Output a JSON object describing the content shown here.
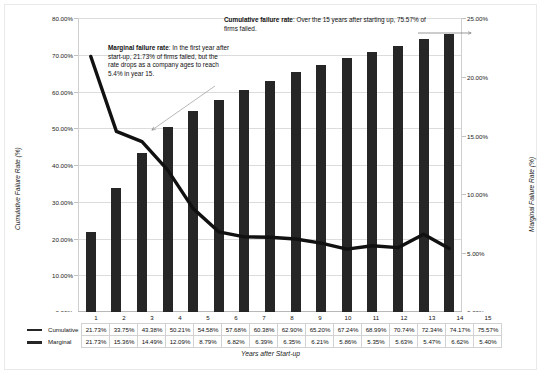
{
  "chart_data": {
    "type": "bar",
    "title": "",
    "xlabel": "Years after Start-up",
    "ylabel": "Cumulative Failure Rate (%)",
    "y2label": "Marginal Failure Rate (%)",
    "categories": [
      "1",
      "2",
      "3",
      "4",
      "5",
      "6",
      "7",
      "8",
      "9",
      "10",
      "11",
      "12",
      "13",
      "14",
      "15"
    ],
    "ylim": [
      0,
      80
    ],
    "y2lim": [
      0,
      25
    ],
    "grid": true,
    "legend_position": "table-below",
    "series": [
      {
        "name": "Cumulative",
        "type": "bar",
        "axis": "left",
        "values": [
          21.73,
          33.75,
          43.38,
          50.21,
          54.58,
          57.68,
          60.38,
          62.9,
          65.2,
          67.24,
          68.99,
          70.74,
          72.34,
          74.17,
          75.57
        ],
        "labels": [
          "21.73%",
          "33.75%",
          "43.38%",
          "50.21%",
          "54.58%",
          "57.68%",
          "60.38%",
          "62.90%",
          "65.20%",
          "67.24%",
          "68.99%",
          "70.74%",
          "72.34%",
          "74.17%",
          "75.57%"
        ],
        "color": "#262626"
      },
      {
        "name": "Marginal",
        "type": "line",
        "axis": "right",
        "values": [
          21.73,
          15.36,
          14.49,
          12.09,
          8.79,
          6.82,
          6.39,
          6.35,
          6.21,
          5.86,
          5.35,
          5.63,
          5.47,
          6.62,
          5.4
        ],
        "labels": [
          "21.73%",
          "15.36%",
          "14.49%",
          "12.09%",
          "8.79%",
          "6.82%",
          "6.39%",
          "6.35%",
          "6.21%",
          "5.86%",
          "5.35%",
          "5.63%",
          "5.47%",
          "6.62%",
          "5.40%"
        ],
        "color": "#111111"
      }
    ],
    "yticks": [
      "0.00%",
      "10.00%",
      "20.00%",
      "30.00%",
      "40.00%",
      "50.00%",
      "60.00%",
      "70.00%",
      "80.00%"
    ],
    "y2ticks": [
      "0.00%",
      "5.00%",
      "10.00%",
      "15.00%",
      "20.00%",
      "25.00%"
    ],
    "annotations": [
      {
        "name": "marginal",
        "lead": "Marginal failure rate",
        "text": ": In the first year after start-up, 21.73% of firms failed, but the rate drops as a company ages to reach 5.4% in year 15."
      },
      {
        "name": "cumulative",
        "lead": "Cumulative failure rate",
        "text": ": Over the 15 years after starting up, 75.57% of firms failed."
      }
    ]
  },
  "table": {
    "row_labels": [
      "Cumulative",
      "Marginal"
    ]
  }
}
